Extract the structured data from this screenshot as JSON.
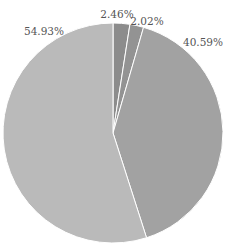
{
  "chart_data": {
    "type": "pie",
    "title": "",
    "start_angle_deg": 0,
    "direction": "clockwise",
    "slices": [
      {
        "label": "2.46%",
        "value": 2.46,
        "color": "#8c8c8c",
        "label_pos": [
          117,
          18
        ],
        "anchor": "middle"
      },
      {
        "label": "2.02%",
        "value": 2.02,
        "color": "#939393",
        "label_pos": [
          147,
          25
        ],
        "anchor": "middle"
      },
      {
        "label": "40.59%",
        "value": 40.59,
        "color": "#a2a2a2",
        "label_pos": [
          203,
          46
        ],
        "anchor": "middle"
      },
      {
        "label": "54.93%",
        "value": 54.93,
        "color": "#bababa",
        "label_pos": [
          44,
          35
        ],
        "anchor": "middle"
      }
    ],
    "center": [
      113,
      133
    ],
    "radius": 110,
    "separator_color": "#ffffff",
    "legend": "none"
  }
}
